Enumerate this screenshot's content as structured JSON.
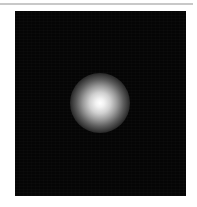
{
  "image": {
    "description": "Dark square field with a single bright Gaussian point source near the center",
    "background_color": "#ffffff",
    "rule_color": "#c8c8c8",
    "field_color": "#050505",
    "spot": {
      "center_x_px": 100,
      "center_y_px": 103,
      "diameter_px": 60,
      "peak_color": "#ffffff"
    }
  }
}
